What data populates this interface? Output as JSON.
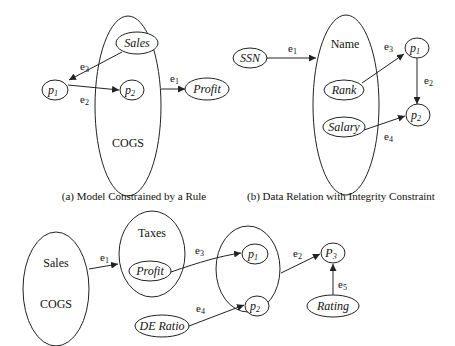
{
  "diagram_a": {
    "caption": "(a) Model Constrained by a Rule",
    "group_label": "COGS",
    "nodes": {
      "p1": {
        "base": "p",
        "sub": "1"
      },
      "p2": {
        "base": "p",
        "sub": "2"
      },
      "sales": "Sales",
      "profit": "Profit"
    },
    "edges": {
      "e1": {
        "base": "e",
        "sub": "1"
      },
      "e2": {
        "base": "e",
        "sub": "2"
      },
      "e3": {
        "base": "e",
        "sub": "3"
      }
    }
  },
  "diagram_b": {
    "caption": "(b) Data Relation with Integrity Constraint",
    "group_label": "Name",
    "nodes": {
      "ssn": "SSN",
      "rank": "Rank",
      "salary": "Salary",
      "p1": {
        "base": "p",
        "sub": "1"
      },
      "p2": {
        "base": "p",
        "sub": "2"
      }
    },
    "edges": {
      "e1": {
        "base": "e",
        "sub": "1"
      },
      "e2": {
        "base": "e",
        "sub": "2"
      },
      "e3": {
        "base": "e",
        "sub": "3"
      },
      "e4": {
        "base": "e",
        "sub": "4"
      }
    }
  },
  "diagram_c": {
    "group1_labels": [
      "Sales",
      "COGS"
    ],
    "group2_label": "Taxes",
    "nodes": {
      "profit": "Profit",
      "de_ratio": "DE Ratio",
      "rating": "Rating",
      "p1": {
        "base": "p",
        "sub": "1"
      },
      "p2": {
        "base": "p",
        "sub": "2"
      },
      "p3": {
        "base": "P",
        "sub": "3"
      }
    },
    "edges": {
      "e1": {
        "base": "e",
        "sub": "1"
      },
      "e2": {
        "base": "e",
        "sub": "2"
      },
      "e3": {
        "base": "e",
        "sub": "3"
      },
      "e4": {
        "base": "e",
        "sub": "4"
      },
      "e5": {
        "base": "e",
        "sub": "5"
      }
    }
  }
}
